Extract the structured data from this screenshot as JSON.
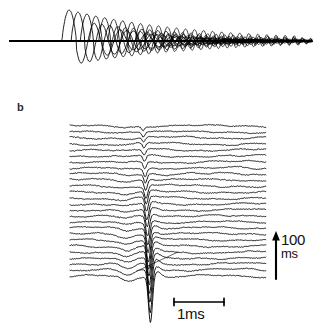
{
  "figure": {
    "kind": "electrophysiology-recording",
    "background_color": "#ffffff",
    "ink_color": "#000000",
    "width": 317,
    "height": 335
  },
  "panels": [
    {
      "id": "a",
      "label": "",
      "description": "Superimposed oscillatory traces with progressively increasing latency and decreasing amplitude, forming a dark wedge toward the right.",
      "baseline_y": 41,
      "x_start": 10,
      "x_end": 310
    },
    {
      "id": "b",
      "label": "b",
      "description": "Stacked waterfall of successive noisy sweeps, each with a large downward spike that grows in amplitude from top to bottom.",
      "x_start": 70,
      "x_end": 266,
      "y_top": 126,
      "y_bottom": 276
    }
  ],
  "labels": {
    "panel_b": "b"
  },
  "scale_bars": {
    "vertical": {
      "value": "100",
      "unit": "ms",
      "x": 276,
      "y_top": 231,
      "y_bottom": 279,
      "has_arrowhead": true,
      "arrow_direction": "up"
    },
    "horizontal": {
      "label": "1ms",
      "x_left": 174,
      "x_right": 224,
      "y": 302,
      "endcap_style": "serif"
    }
  },
  "annotations": [
    {
      "type": "pointer-line",
      "description": "Thin diagonal leader line in lower right of panel b",
      "x1": 178,
      "y1": 252,
      "x2": 137,
      "y2": 271
    }
  ],
  "chart_data": {
    "type": "line",
    "title": "",
    "xlabel": "",
    "ylabel": "",
    "grid": false,
    "legend": false,
    "panel_a": {
      "type": "line",
      "n_traces": 26,
      "baseline_y": 41,
      "sweep_x_start": 10,
      "sweep_x_end": 312,
      "latency_first": 62,
      "latency_step": 9.2,
      "peak_up_first": -33,
      "peak_down_first": 31,
      "amplitude_decay": 0.93,
      "period_first": 26,
      "period_decay": 0.955,
      "damping": 0.52
    },
    "panel_b": {
      "type": "line",
      "n_traces": 26,
      "trace_spacing": 6.0,
      "first_trace_y": 126,
      "x_start": 70,
      "x_end": 266,
      "spike_center_x": 143,
      "spike_center_shift": 0.3,
      "spike_depth_first": 4,
      "spike_depth_last": 46,
      "pre_notch_x": 122,
      "noise_amplitude": 1.0,
      "unit_vertical": "ms",
      "unit_horizontal": "ms",
      "scale_vertical_value": 100,
      "scale_horizontal_value": 1
    }
  }
}
